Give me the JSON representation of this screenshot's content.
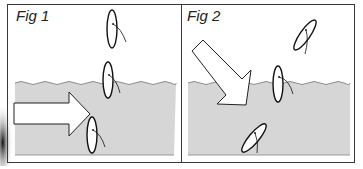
{
  "figures": [
    {
      "id": "fig1",
      "label": "Fig 1",
      "arrow_direction": "horizontal-right",
      "objects": [
        "leaf-above-water",
        "leaf-at-surface",
        "leaf-submerged"
      ]
    },
    {
      "id": "fig2",
      "label": "Fig 2",
      "arrow_direction": "diagonal-down-right",
      "objects": [
        "leaf-above-water-tilted",
        "leaf-at-surface",
        "leaf-submerged-tilted"
      ]
    }
  ],
  "colors": {
    "water": "#d6d6d6",
    "water_edge": "#8a8a8a",
    "border": "#3a3a3a",
    "outline": "#111111",
    "arrow_fill": "#ffffff",
    "background": "#ffffff"
  }
}
